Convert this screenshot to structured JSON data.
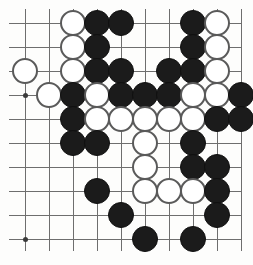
{
  "board": {
    "title": "Go board position",
    "game": "Go (Weiqi / Baduk)",
    "visible_columns": 10,
    "visible_rows": 10,
    "colors": {
      "black_stone": "#1b1b1b",
      "white_stone": "#ffffff",
      "white_stone_outline": "#5a5a5a",
      "grid_line": "#6e6e6e",
      "star_point": "#3a3a3a",
      "background": "#fdfdfc"
    },
    "geometry": {
      "origin_x": 25,
      "origin_y": 23,
      "cell_size": 24,
      "stone_diameter": 26
    },
    "column_x": [
      25,
      49,
      73,
      97,
      121,
      145,
      169,
      193,
      217,
      241
    ],
    "row_y": [
      23,
      47,
      71,
      95,
      119,
      143,
      167,
      191,
      215,
      239
    ],
    "star_points": [
      {
        "col": 1,
        "row": 4
      },
      {
        "col": 1,
        "row": 10
      },
      {
        "col": 6,
        "row": 4
      },
      {
        "col": 6,
        "row": 10
      }
    ],
    "stones": [
      {
        "col": 3,
        "row": 1,
        "color": "white"
      },
      {
        "col": 4,
        "row": 1,
        "color": "black"
      },
      {
        "col": 5,
        "row": 1,
        "color": "black"
      },
      {
        "col": 8,
        "row": 1,
        "color": "black"
      },
      {
        "col": 9,
        "row": 1,
        "color": "white"
      },
      {
        "col": 3,
        "row": 2,
        "color": "white"
      },
      {
        "col": 4,
        "row": 2,
        "color": "black"
      },
      {
        "col": 8,
        "row": 2,
        "color": "black"
      },
      {
        "col": 9,
        "row": 2,
        "color": "white"
      },
      {
        "col": 1,
        "row": 3,
        "color": "white"
      },
      {
        "col": 3,
        "row": 3,
        "color": "white"
      },
      {
        "col": 4,
        "row": 3,
        "color": "black"
      },
      {
        "col": 5,
        "row": 3,
        "color": "black"
      },
      {
        "col": 7,
        "row": 3,
        "color": "black"
      },
      {
        "col": 8,
        "row": 3,
        "color": "black"
      },
      {
        "col": 9,
        "row": 3,
        "color": "white"
      },
      {
        "col": 2,
        "row": 4,
        "color": "white"
      },
      {
        "col": 3,
        "row": 4,
        "color": "black"
      },
      {
        "col": 4,
        "row": 4,
        "color": "white"
      },
      {
        "col": 5,
        "row": 4,
        "color": "black"
      },
      {
        "col": 6,
        "row": 4,
        "color": "black"
      },
      {
        "col": 7,
        "row": 4,
        "color": "black"
      },
      {
        "col": 8,
        "row": 4,
        "color": "white"
      },
      {
        "col": 9,
        "row": 4,
        "color": "white"
      },
      {
        "col": 10,
        "row": 4,
        "color": "black"
      },
      {
        "col": 3,
        "row": 5,
        "color": "black"
      },
      {
        "col": 4,
        "row": 5,
        "color": "white"
      },
      {
        "col": 5,
        "row": 5,
        "color": "white"
      },
      {
        "col": 6,
        "row": 5,
        "color": "white"
      },
      {
        "col": 7,
        "row": 5,
        "color": "white"
      },
      {
        "col": 8,
        "row": 5,
        "color": "white"
      },
      {
        "col": 9,
        "row": 5,
        "color": "black"
      },
      {
        "col": 10,
        "row": 5,
        "color": "black"
      },
      {
        "col": 3,
        "row": 6,
        "color": "black"
      },
      {
        "col": 4,
        "row": 6,
        "color": "black"
      },
      {
        "col": 6,
        "row": 6,
        "color": "white"
      },
      {
        "col": 8,
        "row": 6,
        "color": "black"
      },
      {
        "col": 6,
        "row": 7,
        "color": "white"
      },
      {
        "col": 8,
        "row": 7,
        "color": "black"
      },
      {
        "col": 9,
        "row": 7,
        "color": "black"
      },
      {
        "col": 4,
        "row": 8,
        "color": "black"
      },
      {
        "col": 6,
        "row": 8,
        "color": "white"
      },
      {
        "col": 7,
        "row": 8,
        "color": "white"
      },
      {
        "col": 8,
        "row": 8,
        "color": "white"
      },
      {
        "col": 9,
        "row": 8,
        "color": "black"
      },
      {
        "col": 5,
        "row": 9,
        "color": "black"
      },
      {
        "col": 9,
        "row": 9,
        "color": "black"
      },
      {
        "col": 6,
        "row": 10,
        "color": "black"
      },
      {
        "col": 8,
        "row": 10,
        "color": "black"
      }
    ]
  }
}
